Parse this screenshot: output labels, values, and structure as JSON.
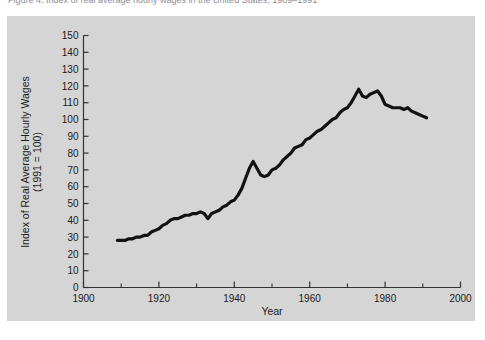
{
  "caption": {
    "text": "Figure 4.   Index of real average hourly wages in the United States, 1909–1991"
  },
  "chart_data": {
    "type": "line",
    "title": "",
    "xlabel": "Year",
    "ylabel": "Index of Real Average Hourly Wages\n(1991 = 100)",
    "ylabel_line1": "Index of Real Average Hourly Wages",
    "ylabel_line2": "(1991 = 100)",
    "xlim": [
      1900,
      2000
    ],
    "ylim": [
      0,
      150
    ],
    "xticks": [
      1900,
      1920,
      1940,
      1960,
      1980,
      2000
    ],
    "xtick_labels": [
      "1900",
      "1920",
      "1940",
      "1960",
      "1980",
      "2000"
    ],
    "xminor_ticks": [
      1910,
      1930,
      1950,
      1970,
      1990
    ],
    "yticks": [
      0,
      10,
      20,
      30,
      40,
      50,
      60,
      70,
      80,
      90,
      100,
      110,
      120,
      130,
      140,
      150
    ],
    "ytick_labels": [
      "0",
      "10",
      "20",
      "30",
      "40",
      "50",
      "60",
      "70",
      "80",
      "90",
      "100",
      "110",
      "120",
      "130",
      "140",
      "150"
    ],
    "grid": false,
    "legend": null,
    "line_color": "#111111",
    "line_width": 3.2,
    "panel_color": "#d5d5d5",
    "series": [
      {
        "name": "Index of Real Average Hourly Wages (1991 = 100)",
        "x": [
          1909,
          1910,
          1911,
          1912,
          1913,
          1914,
          1915,
          1916,
          1917,
          1918,
          1919,
          1920,
          1921,
          1922,
          1923,
          1924,
          1925,
          1926,
          1927,
          1928,
          1929,
          1930,
          1931,
          1932,
          1933,
          1934,
          1935,
          1936,
          1937,
          1938,
          1939,
          1940,
          1941,
          1942,
          1943,
          1944,
          1945,
          1946,
          1947,
          1948,
          1949,
          1950,
          1951,
          1952,
          1953,
          1954,
          1955,
          1956,
          1957,
          1958,
          1959,
          1960,
          1961,
          1962,
          1963,
          1964,
          1965,
          1966,
          1967,
          1968,
          1969,
          1970,
          1971,
          1972,
          1973,
          1974,
          1975,
          1976,
          1977,
          1978,
          1979,
          1980,
          1981,
          1982,
          1983,
          1984,
          1985,
          1986,
          1987,
          1988,
          1989,
          1990,
          1991
        ],
        "y": [
          28,
          28,
          28,
          29,
          29,
          30,
          30,
          31,
          31,
          33,
          34,
          35,
          37,
          38,
          40,
          41,
          41,
          42,
          43,
          43,
          44,
          44,
          45,
          44,
          41,
          44,
          45,
          46,
          48,
          49,
          51,
          52,
          55,
          59,
          65,
          71,
          75,
          71,
          67,
          66,
          67,
          70,
          71,
          73,
          76,
          78,
          80,
          83,
          84,
          85,
          88,
          89,
          91,
          93,
          94,
          96,
          98,
          100,
          101,
          104,
          106,
          107,
          110,
          114,
          118,
          114,
          113,
          115,
          116,
          117,
          114,
          109,
          108,
          107,
          107,
          107,
          106,
          107,
          105,
          104,
          103,
          102,
          101
        ]
      }
    ]
  }
}
